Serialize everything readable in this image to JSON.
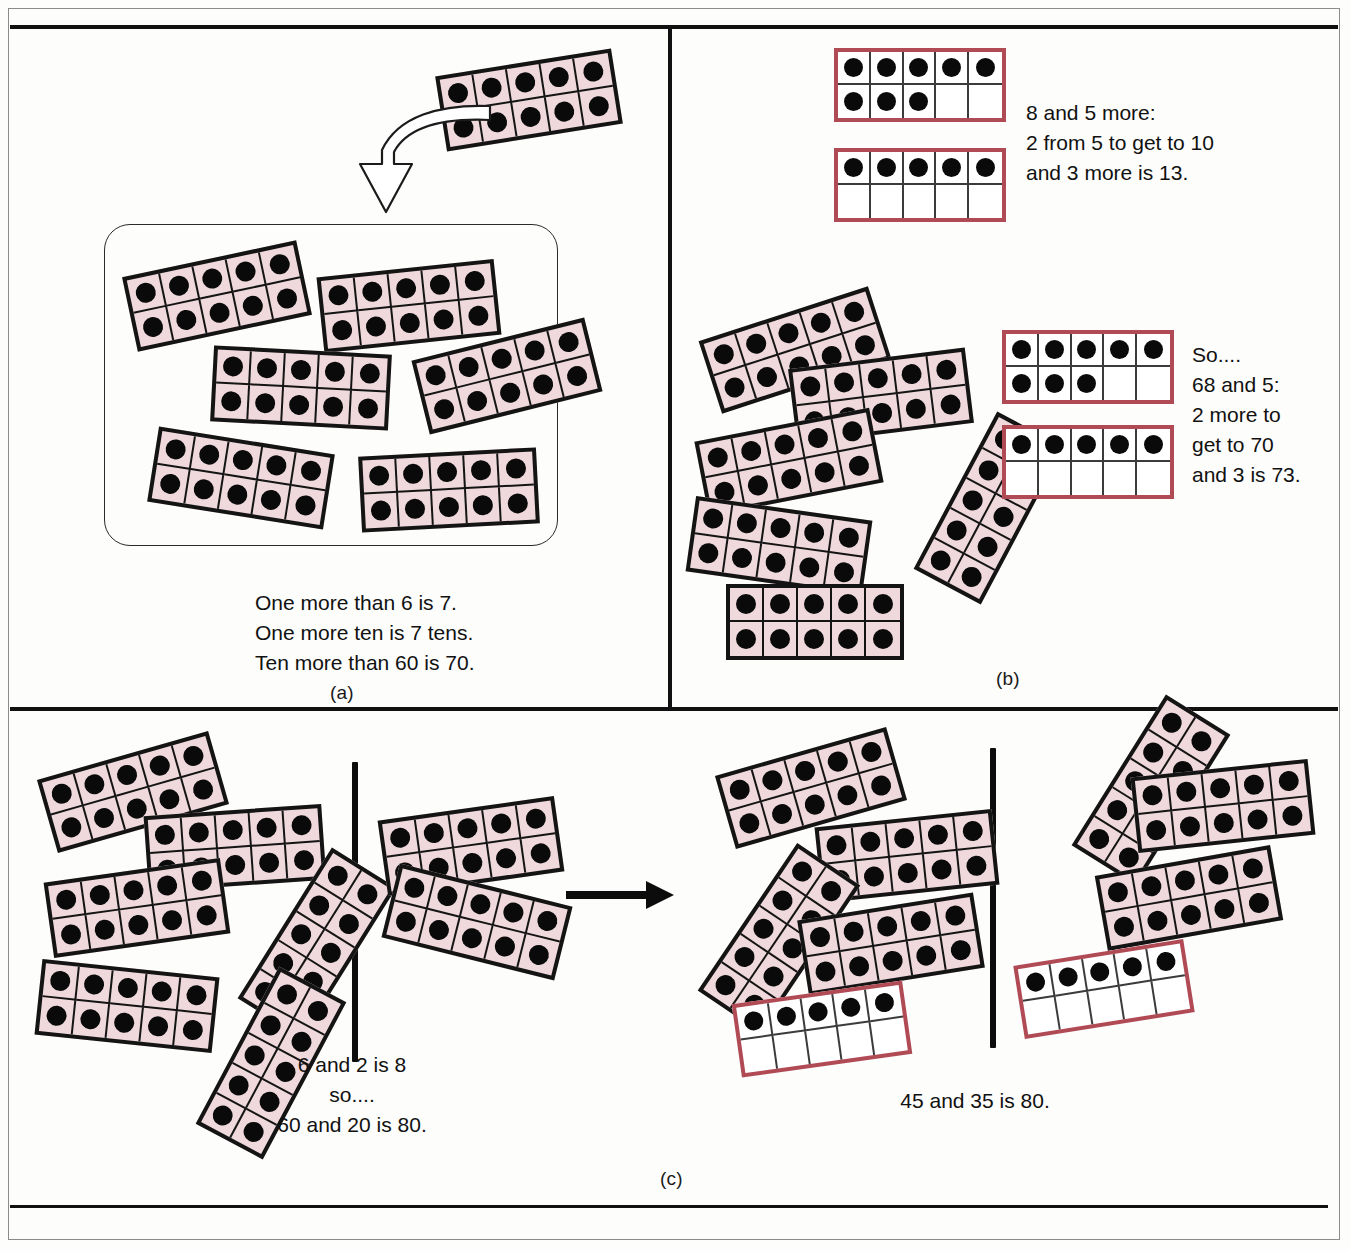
{
  "figure": {
    "panels": [
      {
        "id": "a",
        "label": "(a)"
      },
      {
        "id": "b",
        "label": "(b)"
      },
      {
        "id": "c",
        "label": "(c)"
      }
    ]
  },
  "panel_a": {
    "label": "(a)",
    "caption": "One more than 6 is 7.\nOne more ten is 7 tens.\nTen more than 60 is 70.",
    "source_frame": {
      "name": "ten-frame-source",
      "fill": "pink",
      "dots": 10
    },
    "arrow": {
      "name": "curved-down-arrow",
      "style": "hollow-outline"
    },
    "box_frames": [
      {
        "fill": "pink",
        "dots": 10,
        "rotate": -12,
        "left": 128,
        "top": 258,
        "w": 178,
        "h": 76
      },
      {
        "fill": "pink",
        "dots": 10,
        "rotate": -6,
        "left": 320,
        "top": 268,
        "w": 178,
        "h": 76
      },
      {
        "fill": "pink",
        "dots": 10,
        "rotate": 3,
        "left": 212,
        "top": 350,
        "w": 178,
        "h": 76
      },
      {
        "fill": "pink",
        "dots": 10,
        "rotate": -14,
        "left": 418,
        "top": 338,
        "w": 178,
        "h": 76
      },
      {
        "fill": "pink",
        "dots": 10,
        "rotate": 9,
        "left": 152,
        "top": 440,
        "w": 178,
        "h": 76
      },
      {
        "fill": "pink",
        "dots": 10,
        "rotate": -3,
        "left": 360,
        "top": 452,
        "w": 178,
        "h": 76
      }
    ]
  },
  "panel_b": {
    "label": "(b)",
    "caption_top": "8 and 5 more:\n2 from 5 to get to 10\nand 3 more is 13.",
    "caption_bottom": "So....\n68 and 5:\n2 more to\nget to 70\nand 3 is 73.",
    "top_red_frames": [
      {
        "fill": "red",
        "dots": 8,
        "left": 834,
        "top": 48,
        "w": 172,
        "h": 74,
        "rotate": 0
      },
      {
        "fill": "red",
        "dots": 5,
        "left": 834,
        "top": 148,
        "w": 172,
        "h": 74,
        "rotate": 0
      }
    ],
    "bottom_red_frames": [
      {
        "fill": "red",
        "dots": 8,
        "left": 1002,
        "top": 330,
        "w": 172,
        "h": 74,
        "rotate": 0
      },
      {
        "fill": "red",
        "dots": 5,
        "left": 1002,
        "top": 425,
        "w": 172,
        "h": 74,
        "rotate": 0
      }
    ],
    "pink_frames": [
      {
        "fill": "pink",
        "dots": 10,
        "rotate": -18,
        "left": 706,
        "top": 312,
        "w": 178,
        "h": 76
      },
      {
        "fill": "pink",
        "dots": 10,
        "rotate": -7,
        "left": 792,
        "top": 358,
        "w": 178,
        "h": 76
      },
      {
        "fill": "pink",
        "dots": 10,
        "rotate": -11,
        "left": 700,
        "top": 424,
        "w": 178,
        "h": 76
      },
      {
        "fill": "pink",
        "dots": 10,
        "rotate": -62,
        "left": 900,
        "top": 470,
        "w": 178,
        "h": 76
      },
      {
        "fill": "pink",
        "dots": 10,
        "rotate": 8,
        "left": 690,
        "top": 508,
        "w": 178,
        "h": 76
      },
      {
        "fill": "pink",
        "dots": 10,
        "rotate": 0,
        "left": 726,
        "top": 584,
        "w": 178,
        "h": 76
      }
    ]
  },
  "panel_c": {
    "label": "(c)",
    "caption_left": "6 and 2 is 8\nso....\n60 and 20 is 80.",
    "caption_right": "45 and 35 is 80.",
    "arrow": {
      "name": "right-arrow",
      "style": "solid"
    },
    "group_left": [
      {
        "fill": "pink",
        "dots": 10,
        "rotate": -16,
        "left": 44,
        "top": 754,
        "w": 178,
        "h": 76
      },
      {
        "fill": "pink",
        "dots": 10,
        "rotate": -4,
        "left": 146,
        "top": 810,
        "w": 178,
        "h": 76
      },
      {
        "fill": "pink",
        "dots": 10,
        "rotate": -8,
        "left": 48,
        "top": 870,
        "w": 178,
        "h": 76
      },
      {
        "fill": "pink",
        "dots": 10,
        "rotate": -58,
        "left": 228,
        "top": 905,
        "w": 178,
        "h": 76
      },
      {
        "fill": "pink",
        "dots": 10,
        "rotate": 6,
        "left": 38,
        "top": 968,
        "w": 178,
        "h": 76
      },
      {
        "fill": "pink",
        "dots": 10,
        "rotate": -62,
        "left": 182,
        "top": 1025,
        "w": 178,
        "h": 76
      }
    ],
    "group_mid": [
      {
        "fill": "pink",
        "dots": 10,
        "rotate": -8,
        "left": 382,
        "top": 808,
        "w": 178,
        "h": 76
      },
      {
        "fill": "pink",
        "dots": 10,
        "rotate": 14,
        "left": 388,
        "top": 884,
        "w": 178,
        "h": 76
      }
    ],
    "group_right_a": [
      {
        "fill": "pink",
        "dots": 10,
        "rotate": -16,
        "left": 722,
        "top": 750,
        "w": 178,
        "h": 76
      },
      {
        "fill": "pink",
        "dots": 10,
        "rotate": -6,
        "left": 818,
        "top": 818,
        "w": 178,
        "h": 76
      },
      {
        "fill": "pink",
        "dots": 10,
        "rotate": -56,
        "left": 690,
        "top": 900,
        "w": 178,
        "h": 76
      },
      {
        "fill": "pink",
        "dots": 10,
        "rotate": -9,
        "left": 802,
        "top": 906,
        "w": 178,
        "h": 76
      },
      {
        "fill": "red",
        "dots": 5,
        "rotate": -8,
        "left": 736,
        "top": 992,
        "w": 172,
        "h": 74
      }
    ],
    "group_right_b": [
      {
        "fill": "pink",
        "dots": 10,
        "rotate": -58,
        "left": 1062,
        "top": 752,
        "w": 178,
        "h": 76
      },
      {
        "fill": "pink",
        "dots": 10,
        "rotate": -6,
        "left": 1134,
        "top": 768,
        "w": 178,
        "h": 76
      },
      {
        "fill": "pink",
        "dots": 10,
        "rotate": -10,
        "left": 1100,
        "top": 860,
        "w": 178,
        "h": 76
      },
      {
        "fill": "red",
        "dots": 5,
        "rotate": -9,
        "left": 1018,
        "top": 952,
        "w": 172,
        "h": 74
      }
    ],
    "separators": [
      {
        "name": "divider-left",
        "left": 352,
        "top": 762,
        "h": 300
      },
      {
        "name": "divider-right",
        "left": 990,
        "top": 748,
        "h": 300
      }
    ]
  },
  "colors": {
    "rod_fill": "#efd9dd",
    "rod_border": "#141414",
    "red_frame_border": "#b04a55",
    "dot": "#0a0a0a",
    "rule": "#111111"
  }
}
